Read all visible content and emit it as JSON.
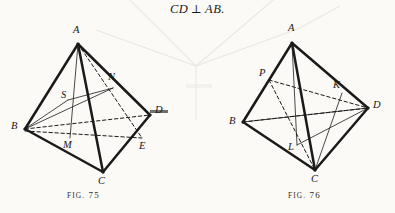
{
  "page": {
    "width": 395,
    "height": 213,
    "background_color": "#fbfaf7",
    "ink_color": "#1a1a1a"
  },
  "formula": {
    "lhs": "CD",
    "operator": "⊥",
    "rhs": "AB."
  },
  "figures": [
    {
      "id": "fig-75",
      "caption_word": "FIG.",
      "caption_number": "75",
      "caption_full": "FIG. 75",
      "caption_pos": {
        "x": 67,
        "y": 190
      },
      "vertices": [
        {
          "name": "A",
          "label": "A",
          "x": 78,
          "y": 44,
          "label_x": 73,
          "label_y": 25
        },
        {
          "name": "B",
          "label": "B",
          "x": 25,
          "y": 129,
          "label_x": 11,
          "label_y": 121
        },
        {
          "name": "C",
          "label": "C",
          "x": 103,
          "y": 172,
          "label_x": 98,
          "label_y": 176
        },
        {
          "name": "D",
          "label": "D",
          "x": 150,
          "y": 115,
          "label_x": 155,
          "label_y": 105
        },
        {
          "name": "E",
          "label": "E",
          "x": 142,
          "y": 138,
          "label_x": 139,
          "label_y": 141
        },
        {
          "name": "M",
          "label": "M",
          "x": 70,
          "y": 138,
          "label_x": 63,
          "label_y": 140
        },
        {
          "name": "N",
          "label": "N",
          "x": 113,
          "y": 88,
          "label_x": 108,
          "label_y": 72
        },
        {
          "name": "S",
          "label": "S",
          "x": 68,
          "y": 100,
          "label_x": 61,
          "label_y": 90
        }
      ],
      "solid_edges": [
        [
          "A",
          "B"
        ],
        [
          "A",
          "C"
        ],
        [
          "A",
          "D"
        ],
        [
          "B",
          "C"
        ],
        [
          "C",
          "D"
        ]
      ],
      "dashed_edges": [
        [
          "B",
          "D"
        ],
        [
          "A",
          "E"
        ],
        [
          "B",
          "E"
        ],
        [
          "N",
          "E"
        ]
      ],
      "thin_edges": [
        [
          "B",
          "N"
        ],
        [
          "A",
          "M"
        ],
        [
          "B",
          "S"
        ],
        [
          "S",
          "N"
        ]
      ]
    },
    {
      "id": "fig-76",
      "caption_word": "FIG.",
      "caption_number": "76",
      "caption_full": "FIG. 76",
      "caption_pos": {
        "x": 288,
        "y": 190
      },
      "vertices": [
        {
          "name": "A",
          "label": "A",
          "x": 292,
          "y": 43,
          "label_x": 288,
          "label_y": 23
        },
        {
          "name": "B",
          "label": "B",
          "x": 243,
          "y": 122,
          "label_x": 229,
          "label_y": 116
        },
        {
          "name": "C",
          "label": "C",
          "x": 315,
          "y": 170,
          "label_x": 311,
          "label_y": 174
        },
        {
          "name": "D",
          "label": "D",
          "x": 368,
          "y": 108,
          "label_x": 373,
          "label_y": 100
        },
        {
          "name": "P",
          "label": "P",
          "x": 269,
          "y": 80,
          "label_x": 259,
          "label_y": 68
        },
        {
          "name": "K",
          "label": "K",
          "x": 342,
          "y": 93,
          "label_x": 333,
          "label_y": 80
        },
        {
          "name": "L",
          "label": "L",
          "x": 297,
          "y": 145,
          "label_x": 288,
          "label_y": 142
        }
      ],
      "solid_edges": [
        [
          "A",
          "B"
        ],
        [
          "A",
          "C"
        ],
        [
          "A",
          "D"
        ],
        [
          "B",
          "C"
        ],
        [
          "C",
          "D"
        ]
      ],
      "dashed_edges": [
        [
          "B",
          "D"
        ],
        [
          "P",
          "D"
        ],
        [
          "P",
          "C"
        ]
      ],
      "thin_edges": [
        [
          "B",
          "K"
        ],
        [
          "K",
          "C"
        ],
        [
          "L",
          "D"
        ],
        [
          "A",
          "L"
        ]
      ]
    }
  ]
}
